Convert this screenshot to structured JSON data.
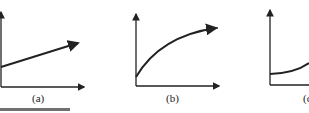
{
  "panels": [
    {
      "id": "a",
      "label": "(a)",
      "curve": "linear increasing"
    },
    {
      "id": "b",
      "label": "(b)",
      "curve": "concave increasing (decelerating)"
    },
    {
      "id": "c",
      "label": "(c)",
      "curve": "convex increasing (accelerating)"
    }
  ],
  "footer_fragment": "FIGURE 2.17",
  "colors": {
    "line": "#222222",
    "background": "#ffffff"
  }
}
